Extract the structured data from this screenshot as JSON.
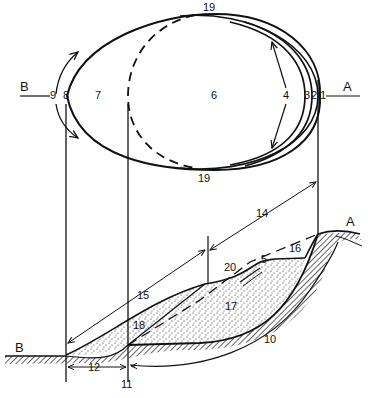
{
  "diagram": {
    "type": "landslide-nomenclature",
    "views": [
      "plan",
      "cross-section"
    ],
    "section_labels": {
      "left": "B",
      "right": "A"
    },
    "plan_labels": [
      {
        "id": "9",
        "text": "9"
      },
      {
        "id": "8",
        "text": "8"
      },
      {
        "id": "7",
        "text": "7"
      },
      {
        "id": "6",
        "text": "6"
      },
      {
        "id": "4",
        "text": "4"
      },
      {
        "id": "3",
        "text": "3"
      },
      {
        "id": "2",
        "text": "2"
      },
      {
        "id": "1",
        "text": "1"
      },
      {
        "id": "19-top",
        "text": "19"
      },
      {
        "id": "19-bottom",
        "text": "19"
      }
    ],
    "section_number_labels": [
      {
        "id": "14",
        "text": "14"
      },
      {
        "id": "16",
        "text": "16"
      },
      {
        "id": "5",
        "text": "5"
      },
      {
        "id": "20",
        "text": "20"
      },
      {
        "id": "15",
        "text": "15"
      },
      {
        "id": "17",
        "text": "17"
      },
      {
        "id": "18",
        "text": "18"
      },
      {
        "id": "10",
        "text": "10"
      },
      {
        "id": "12",
        "text": "12"
      },
      {
        "id": "11",
        "text": "11"
      }
    ],
    "colors": {
      "ink": "#111111",
      "background": "#ffffff"
    }
  }
}
